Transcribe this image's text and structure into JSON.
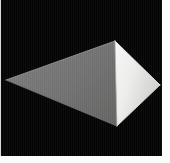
{
  "viewer": {
    "name": "3d-shape-render-thumbnail",
    "background_color": "#fbfbfb",
    "canvas_background": "#030303",
    "canvas_rect": {
      "x": 1,
      "y": 0,
      "width": 161,
      "height": 156
    },
    "margin_color": "#fcfcfc",
    "rule_color": "#d8d8d8"
  },
  "scene": {
    "object_label": "pyramid",
    "object_description": "Shaded three-dimensional pyramid rendered on a black background",
    "lighting": "directional light from the right",
    "vertices": {
      "apex": {
        "x": 115,
        "y": 42
      },
      "left": {
        "x": 6,
        "y": 81
      },
      "right": {
        "x": 160,
        "y": 86
      },
      "bottom": {
        "x": 117,
        "y": 127
      }
    },
    "faces": [
      {
        "name": "left-face",
        "label": "Left shaded face",
        "fill": "#70716f",
        "fill_light": "#7c7d7b",
        "fill_dark": "#5f605e",
        "points": "6,81 115,42 117,127"
      },
      {
        "name": "right-face",
        "label": "Right highlighted face",
        "fill": "#ececec",
        "fill_light": "#f6f6f6",
        "fill_dark": "#c9c9c9",
        "points": "115,42 160,86 117,127"
      }
    ],
    "edges": [
      {
        "name": "edge-apex-left",
        "from": "apex",
        "to": "left",
        "stroke": "#8e8f8d"
      },
      {
        "name": "edge-apex-right",
        "from": "apex",
        "to": "right",
        "stroke": "#f4f4f4"
      },
      {
        "name": "edge-left-bottom",
        "from": "left",
        "to": "bottom",
        "stroke": "#6a6b69"
      },
      {
        "name": "edge-right-bottom",
        "from": "right",
        "to": "bottom",
        "stroke": "#d2d2d2"
      },
      {
        "name": "edge-apex-bottom",
        "from": "apex",
        "to": "bottom",
        "stroke": "#b6b7b5"
      }
    ]
  }
}
